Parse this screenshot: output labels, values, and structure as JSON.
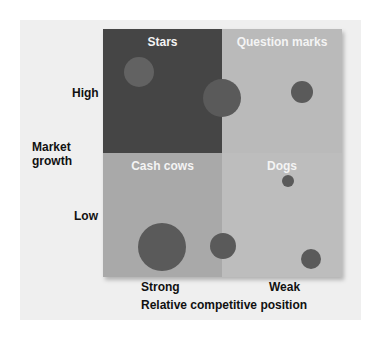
{
  "quadrants": {
    "stars": "Stars",
    "question_marks": "Question marks",
    "cash_cows": "Cash cows",
    "dogs": "Dogs"
  },
  "y_axis": {
    "title_line1": "Market",
    "title_line2": "growth",
    "high": "High",
    "low": "Low"
  },
  "x_axis": {
    "title": "Relative competitive position",
    "strong": "Strong",
    "weak": "Weak"
  },
  "colors": {
    "stars": "#454545",
    "question_marks": "#bababa",
    "cash_cows": "#a9a9a9",
    "dogs": "#bdbdbd",
    "circle": "#5a5a5a"
  },
  "circles": [
    {
      "quadrant": "stars",
      "cx": 139,
      "cy": 72,
      "r": 15
    },
    {
      "quadrant": "stars/question_marks",
      "cx": 222,
      "cy": 98,
      "r": 19
    },
    {
      "quadrant": "question_marks",
      "cx": 302,
      "cy": 92,
      "r": 11
    },
    {
      "quadrant": "cash_cows",
      "cx": 162,
      "cy": 247,
      "r": 24
    },
    {
      "quadrant": "cash_cows/dogs",
      "cx": 223,
      "cy": 246,
      "r": 13
    },
    {
      "quadrant": "dogs",
      "cx": 288,
      "cy": 181,
      "r": 6
    },
    {
      "quadrant": "dogs",
      "cx": 311,
      "cy": 259,
      "r": 10
    }
  ]
}
